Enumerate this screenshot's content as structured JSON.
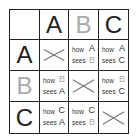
{
  "headers": {
    "columns": [
      {
        "label": "A",
        "style": "dark"
      },
      {
        "label": "B",
        "style": "light"
      },
      {
        "label": "C",
        "style": "dark"
      }
    ],
    "rows": [
      {
        "label": "A",
        "style": "dark"
      },
      {
        "label": "B",
        "style": "light"
      },
      {
        "label": "C",
        "style": "dark"
      }
    ]
  },
  "cells": {
    "A_B": {
      "word1": "how",
      "word2": "sees",
      "subject": "A",
      "object": "B"
    },
    "A_C": {
      "word1": "how",
      "word2": "sees",
      "subject": "A",
      "object": "C"
    },
    "B_A": {
      "word1": "how",
      "word2": "sees",
      "subject": "B",
      "object": "A"
    },
    "B_C": {
      "word1": "how",
      "word2": "sees",
      "subject": "B",
      "object": "C"
    },
    "C_A": {
      "word1": "how",
      "word2": "sees",
      "subject": "C",
      "object": "A"
    },
    "C_B": {
      "word1": "how",
      "word2": "sees",
      "subject": "C",
      "object": "B"
    }
  },
  "diagonal_marker": "cross-icon",
  "colors": {
    "dark": "#222222",
    "light": "#aaaaaa",
    "line": "#222222",
    "cross": "#777777"
  }
}
